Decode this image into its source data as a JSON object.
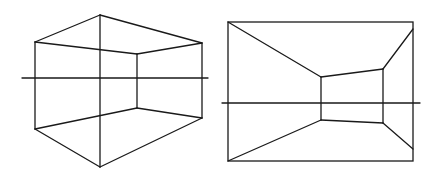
{
  "diagram": {
    "type": "perspective-drawings",
    "stroke_color": "#1a1a1a",
    "background": "#ffffff",
    "figures": [
      {
        "name": "two-point-perspective-room-corner",
        "horizon": {
          "x1": 22,
          "y1": 78,
          "x2": 208,
          "y2": 78
        },
        "vertices": {
          "top_apex": [
            100,
            15
          ],
          "bottom_apex": [
            100,
            167
          ],
          "left_top": [
            35,
            42
          ],
          "left_bottom": [
            35,
            129
          ],
          "right_top": [
            202,
            43
          ],
          "right_bottom": [
            202,
            118
          ],
          "inner_top": [
            137,
            54
          ],
          "inner_bottom": [
            137,
            108
          ]
        },
        "lines": [
          [
            [
              100,
              15
            ],
            [
              35,
              42
            ]
          ],
          [
            [
              100,
              15
            ],
            [
              202,
              43
            ]
          ],
          [
            [
              35,
              42
            ],
            [
              35,
              129
            ]
          ],
          [
            [
              202,
              43
            ],
            [
              202,
              118
            ]
          ],
          [
            [
              35,
              129
            ],
            [
              100,
              167
            ]
          ],
          [
            [
              100,
              167
            ],
            [
              202,
              118
            ]
          ],
          [
            [
              100,
              15
            ],
            [
              100,
              167
            ]
          ],
          [
            [
              35,
              42
            ],
            [
              137,
              54
            ]
          ],
          [
            [
              137,
              54
            ],
            [
              202,
              43
            ]
          ],
          [
            [
              35,
              129
            ],
            [
              137,
              108
            ]
          ],
          [
            [
              137,
              108
            ],
            [
              202,
              118
            ]
          ],
          [
            [
              137,
              54
            ],
            [
              137,
              108
            ]
          ]
        ]
      },
      {
        "name": "one-point-perspective-room",
        "horizon": {
          "x1": 222,
          "y1": 103,
          "x2": 420,
          "y2": 103
        },
        "frame": {
          "x": 228,
          "y": 22,
          "width": 185,
          "height": 139
        },
        "vertices": {
          "inner_left_top": [
            321,
            77
          ],
          "inner_right_top": [
            383,
            69
          ],
          "inner_left_bottom": [
            321,
            120
          ],
          "inner_right_bottom": [
            383,
            123
          ],
          "right_top_end": [
            413,
            29
          ],
          "right_bottom_end": [
            413,
            149
          ]
        },
        "lines": [
          [
            [
              228,
              22
            ],
            [
              321,
              77
            ]
          ],
          [
            [
              228,
              161
            ],
            [
              321,
              120
            ]
          ],
          [
            [
              383,
              69
            ],
            [
              413,
              29
            ]
          ],
          [
            [
              383,
              123
            ],
            [
              413,
              149
            ]
          ],
          [
            [
              321,
              77
            ],
            [
              383,
              69
            ]
          ],
          [
            [
              321,
              120
            ],
            [
              383,
              123
            ]
          ],
          [
            [
              321,
              77
            ],
            [
              321,
              120
            ]
          ],
          [
            [
              383,
              69
            ],
            [
              383,
              123
            ]
          ]
        ]
      }
    ]
  }
}
